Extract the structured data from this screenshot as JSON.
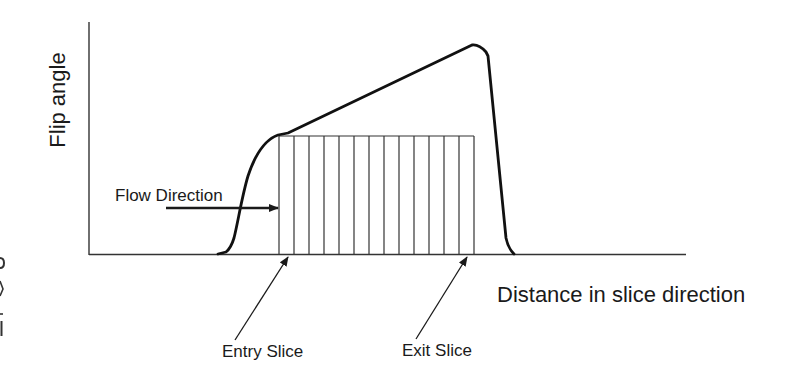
{
  "diagram": {
    "type": "flip-angle-profile",
    "y_axis_label": "Flip angle",
    "x_axis_label": "Distance in slice direction",
    "annotations": {
      "flow_direction": "Flow Direction",
      "entry_slice": "Entry Slice",
      "exit_slice": "Exit Slice"
    },
    "slab": {
      "slice_count": 13,
      "description": "Multi-slice slab with ramped (TONE) flip angle increasing from entry to exit slice"
    },
    "edge_fragments": [
      "o",
      "v",
      "-",
      "l"
    ],
    "colors": {
      "line": "#1a1a1a",
      "background": "#ffffff"
    }
  }
}
